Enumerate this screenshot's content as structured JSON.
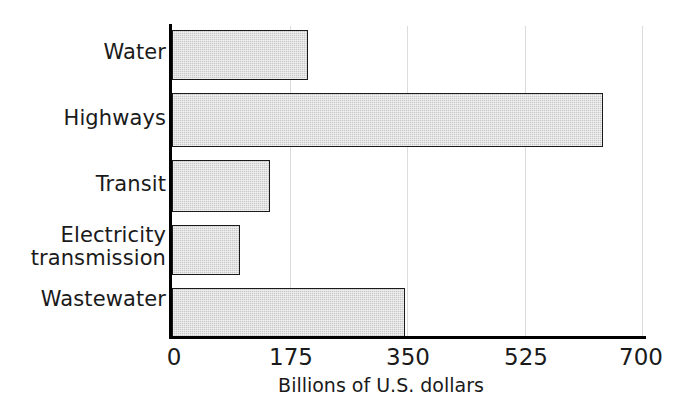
{
  "chart_data": {
    "type": "bar",
    "orientation": "horizontal",
    "title": "",
    "subtitle": "",
    "xlabel": "Billions of U.S. dollars",
    "ylabel": "",
    "categories": [
      "Water",
      "Highways",
      "Transit",
      "Electricity transmission",
      "Wastewater"
    ],
    "values": [
      202,
      640,
      146,
      101,
      346
    ],
    "series": [
      {
        "name": "Investment need",
        "values": [
          202,
          640,
          146,
          101,
          346
        ]
      }
    ],
    "xlim": [
      0,
      700
    ],
    "xticks": [
      0,
      175,
      350,
      525,
      700
    ],
    "xtick_labels": [
      "0",
      "175",
      "350",
      "525",
      "700"
    ],
    "grid": "vertical",
    "legend": "none",
    "bar_fill_color": "#c9c9c9",
    "bar_edge_color": "#1a1a1a",
    "axis_color": "#000000",
    "gridline_color": "#dcdcdc",
    "annotations": []
  },
  "axis": {
    "x_title": "Billions of U.S. dollars",
    "tick_labels": [
      "0",
      "175",
      "350",
      "525",
      "700"
    ]
  },
  "categories": [
    {
      "label": "Water",
      "value": 202
    },
    {
      "label": "Highways",
      "value": 640
    },
    {
      "label": "Transit",
      "value": 146
    },
    {
      "label": "Electricity\ntransmission",
      "value": 101
    },
    {
      "label": "Wastewater",
      "value": 346
    }
  ]
}
